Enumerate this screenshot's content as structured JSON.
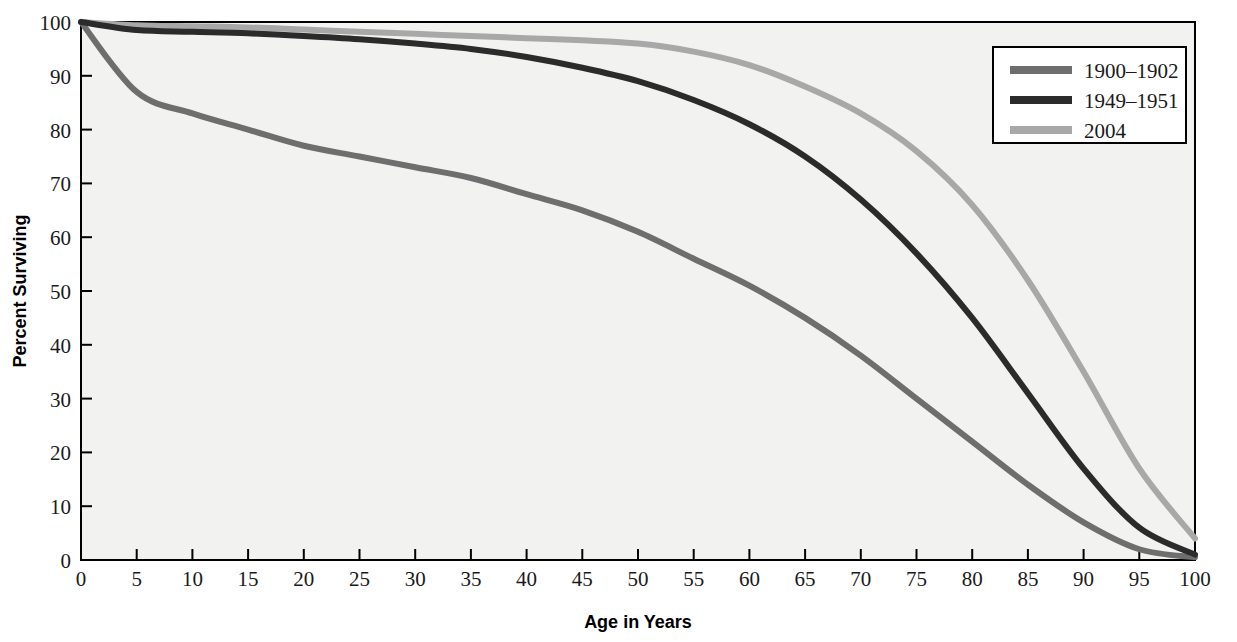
{
  "chart_data": {
    "type": "line",
    "title": "",
    "xlabel": "Age in Years",
    "ylabel": "Percent Surviving",
    "xlim": [
      0,
      100
    ],
    "ylim": [
      0,
      100
    ],
    "xticks": [
      0,
      5,
      10,
      15,
      20,
      25,
      30,
      35,
      40,
      45,
      50,
      55,
      60,
      65,
      70,
      75,
      80,
      85,
      90,
      95,
      100
    ],
    "yticks": [
      0,
      10,
      20,
      30,
      40,
      50,
      60,
      70,
      80,
      90,
      100
    ],
    "grid": false,
    "legend_position": "top-right",
    "x": [
      0,
      5,
      10,
      15,
      20,
      25,
      30,
      35,
      40,
      45,
      50,
      55,
      60,
      65,
      70,
      75,
      80,
      85,
      90,
      95,
      100
    ],
    "series": [
      {
        "name": "1900–1902",
        "color": "#6e6e6e",
        "values": [
          100,
          87,
          83,
          80,
          77,
          75,
          73,
          71,
          68,
          65,
          61,
          56,
          51,
          45,
          38,
          30,
          22,
          14,
          7,
          2,
          0.5
        ]
      },
      {
        "name": "1949–1951",
        "color": "#2b2b2b",
        "values": [
          100,
          98.5,
          98.2,
          97.9,
          97.4,
          96.8,
          96,
          95,
          93.5,
          91.5,
          89,
          85.5,
          81,
          75,
          67,
          57,
          45,
          31,
          17,
          6,
          1
        ]
      },
      {
        "name": "2004",
        "color": "#a8a8a8",
        "values": [
          100,
          99.4,
          99.2,
          99,
          98.6,
          98.2,
          97.8,
          97.4,
          97,
          96.6,
          96,
          94.5,
          92,
          88,
          83,
          76,
          66,
          52,
          35,
          17,
          4
        ]
      }
    ]
  },
  "legend": {
    "entries": [
      {
        "label": "1900–1902"
      },
      {
        "label": "1949–1951"
      },
      {
        "label": "2004"
      }
    ]
  },
  "axes": {
    "x_title": "Age in Years",
    "y_title": "Percent Surviving"
  },
  "colors": {
    "series_1900": "#6e6e6e",
    "series_1949": "#2b2b2b",
    "series_2004": "#a8a8a8",
    "plot_background": "#f2f2f0",
    "frame": "#000000"
  }
}
